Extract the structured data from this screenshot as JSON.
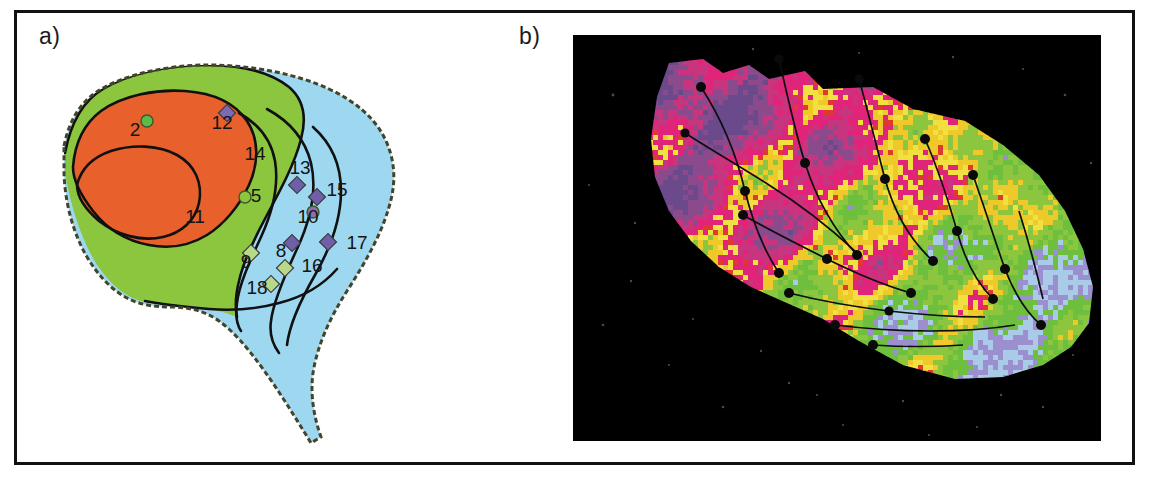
{
  "figure": {
    "panels": [
      {
        "id": "panel-a",
        "label": "a)",
        "type": "zone-map",
        "description": "Management zone map of a field delineated into three colour-coded zones with numbered sampling sites",
        "zone_colors": {
          "orange": "#E8602C",
          "green": "#8CC63E",
          "blue": "#9ED8F0",
          "boundary": "#4a4a2a",
          "contour": "#111111"
        },
        "sample_labels": [
          {
            "id": "2",
            "x": 118,
            "y": 123,
            "marker": "circle",
            "marker_color": "#5DBB4A",
            "mx": 130,
            "my": 108
          },
          {
            "id": "11",
            "x": 178,
            "y": 210,
            "marker": "none",
            "marker_color": "",
            "mx": 0,
            "my": 0
          },
          {
            "id": "12",
            "x": 205,
            "y": 116,
            "marker": "diamond",
            "marker_color": "#7B6BB0",
            "mx": 210,
            "my": 100
          },
          {
            "id": "14",
            "x": 238,
            "y": 147,
            "marker": "none",
            "marker_color": "",
            "mx": 0,
            "my": 0
          },
          {
            "id": "5",
            "x": 239,
            "y": 189,
            "marker": "circle",
            "marker_color": "#8CC63E",
            "mx": 228,
            "my": 184
          },
          {
            "id": "13",
            "x": 283,
            "y": 161,
            "marker": "diamond",
            "marker_color": "#6E5FA8",
            "mx": 280,
            "my": 172
          },
          {
            "id": "15",
            "x": 320,
            "y": 183,
            "marker": "diamond",
            "marker_color": "#6E5FA8",
            "mx": 300,
            "my": 184
          },
          {
            "id": "10",
            "x": 291,
            "y": 210,
            "marker": "circle",
            "marker_color": "#8C6FA8",
            "mx": 296,
            "my": 199
          },
          {
            "id": "17",
            "x": 340,
            "y": 236,
            "marker": "diamond",
            "marker_color": "#6E5FA8",
            "mx": 311,
            "my": 229
          },
          {
            "id": "8",
            "x": 264,
            "y": 244,
            "marker": "diamond",
            "marker_color": "#6E5FA8",
            "mx": 275,
            "my": 230
          },
          {
            "id": "9",
            "x": 229,
            "y": 255,
            "marker": "diamond",
            "marker_color": "#B8D98A",
            "mx": 234,
            "my": 240
          },
          {
            "id": "16",
            "x": 295,
            "y": 259,
            "marker": "diamond",
            "marker_color": "#B8D98A",
            "mx": 268,
            "my": 255
          },
          {
            "id": "18",
            "x": 240,
            "y": 281,
            "marker": "diamond",
            "marker_color": "#B8D98A",
            "mx": 254,
            "my": 271
          }
        ]
      },
      {
        "id": "panel-b",
        "label": "b)",
        "type": "raster-image",
        "description": "Classified remote-sensing raster of the same field on a black background with sampling nodes connected by transect lines",
        "background_color": "#000000",
        "raster_colors": [
          "#E0247A",
          "#C8357F",
          "#8B4A8C",
          "#6B4A8C",
          "#F0E040",
          "#EFC92A",
          "#8CC63E",
          "#6FBF3F",
          "#A9CBE8",
          "#9B8FD0",
          "#E03A2F"
        ]
      }
    ]
  }
}
